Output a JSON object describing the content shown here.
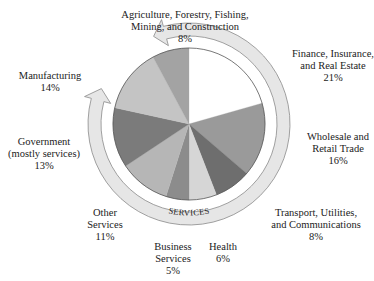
{
  "chart_data": {
    "type": "pie",
    "title": "",
    "start_angle_deg": 0,
    "direction": "clockwise",
    "slices": [
      {
        "label_lines": [
          "Finance, Insurance,",
          "and Real Estate"
        ],
        "label": "Finance, Insurance, and Real Estate",
        "value": 21,
        "value_text": "21%",
        "color": "#ffffff"
      },
      {
        "label_lines": [
          "Wholesale and",
          "Retail Trade"
        ],
        "label": "Wholesale and Retail Trade",
        "value": 16,
        "value_text": "16%",
        "color": "#9a9a9a"
      },
      {
        "label_lines": [
          "Transport, Utilities,",
          "and Communications"
        ],
        "label": "Transport, Utilities, and Communications",
        "value": 8,
        "value_text": "8%",
        "color": "#6e6e6e"
      },
      {
        "label_lines": [
          "Health"
        ],
        "label": "Health",
        "value": 6,
        "value_text": "6%",
        "color": "#d6d6d6"
      },
      {
        "label_lines": [
          "Business",
          "Services"
        ],
        "label": "Business Services",
        "value": 5,
        "value_text": "5%",
        "color": "#8c8c8c"
      },
      {
        "label_lines": [
          "Other",
          "Services"
        ],
        "label": "Other Services",
        "value": 11,
        "value_text": "11%",
        "color": "#b6b6b6"
      },
      {
        "label_lines": [
          "Government",
          "(mostly services)"
        ],
        "label": "Government (mostly services)",
        "value": 13,
        "value_text": "13%",
        "color": "#7b7b7b"
      },
      {
        "label_lines": [
          "Manufacturing"
        ],
        "label": "Manufacturing",
        "value": 14,
        "value_text": "14%",
        "color": "#c4c4c4"
      },
      {
        "label_lines": [
          "Agriculture, Forestry, Fishing,",
          "Mining, and Construction"
        ],
        "label": "Agriculture, Forestry, Fishing, Mining, and Construction",
        "value": 8,
        "value_text": "8%",
        "color": "#a3a3a3"
      }
    ],
    "annotation": {
      "text": "SERVICES",
      "shape": "double-headed curved arrow encircling the service sectors"
    }
  },
  "labels": {
    "finance": {
      "l1": "Finance, Insurance,",
      "l2": "and Real Estate",
      "pct": "21%"
    },
    "wholesale": {
      "l1": "Wholesale and",
      "l2": "Retail Trade",
      "pct": "16%"
    },
    "transport": {
      "l1": "Transport, Utilities,",
      "l2": "and Communications",
      "pct": "8%"
    },
    "health": {
      "l1": "Health",
      "pct": "6%"
    },
    "business": {
      "l1": "Business",
      "l2": "Services",
      "pct": "5%"
    },
    "other": {
      "l1": "Other",
      "l2": "Services",
      "pct": "11%"
    },
    "government": {
      "l1": "Government",
      "l2": "(mostly services)",
      "pct": "13%"
    },
    "manufacturing": {
      "l1": "Manufacturing",
      "pct": "14%"
    },
    "agriculture": {
      "l1": "Agriculture, Forestry, Fishing,",
      "l2": "Mining, and Construction",
      "pct": "8%"
    }
  },
  "ring": {
    "label": "SERVICES",
    "fill": "#e6e6e6",
    "stroke": "#8a8a8a"
  }
}
